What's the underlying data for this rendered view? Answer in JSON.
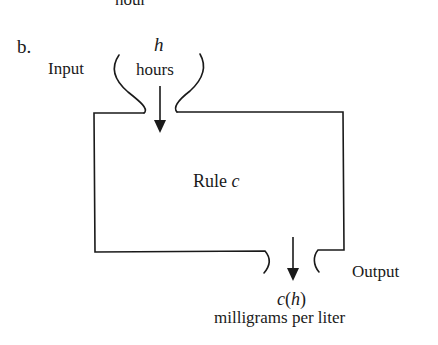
{
  "top_fragment": "hour",
  "part_label": "b.",
  "input": {
    "side_label": "Input",
    "variable": "h",
    "unit": "hours"
  },
  "machine": {
    "rule_label": "Rule",
    "rule_name": "c"
  },
  "output": {
    "side_label": "Output",
    "expr_func": "c",
    "expr_open": "(",
    "expr_var": "h",
    "expr_close": ")",
    "unit": "milligrams per liter"
  },
  "colors": {
    "stroke": "#1a1a1a",
    "background": "#ffffff"
  }
}
